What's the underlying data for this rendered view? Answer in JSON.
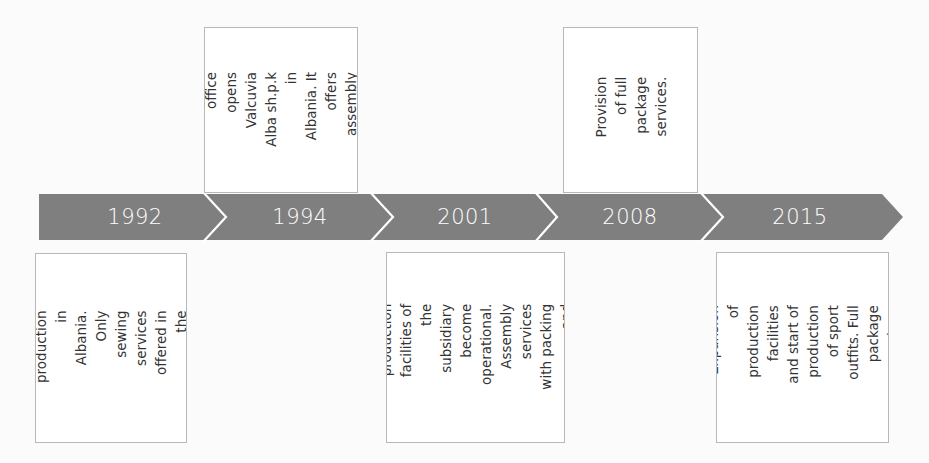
{
  "colors": {
    "arrow_fill": "#7f7f7f",
    "separator": "#ffffff",
    "box_border": "#b8b8b8",
    "text": "#333333"
  },
  "timeline": {
    "milestones": [
      {
        "year": "1992",
        "position": "below",
        "description": "Start of production in\nAlbania. Only sewing\nservices offered in\nthe subsidiary."
      },
      {
        "year": "1994",
        "position": "above",
        "description": "The head office\nopens Valcuvia\nAlba sh.p.k in\nAlbania. It offers\nassembly services."
      },
      {
        "year": "2001",
        "position": "below",
        "description": "The new production\nfacilities of the\nsubsidiary become\noperational.\nAssembly services\nwith packing and\ninventory."
      },
      {
        "year": "2008",
        "position": "above",
        "description": "Provision of full\npackage services."
      },
      {
        "year": "2015",
        "position": "below",
        "description": "Expansion of\nproduction facilities\nand start of\nproduction of sport\noutfits. Full package\nservices."
      }
    ]
  }
}
